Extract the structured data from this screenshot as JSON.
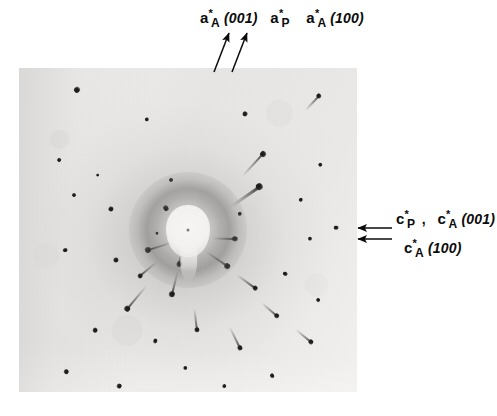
{
  "figure": {
    "kind": "x-ray-diffraction-photograph"
  },
  "labels": {
    "top": {
      "item1": {
        "symbol": "a",
        "star": "*",
        "subscript": "A",
        "miller": "(001)"
      },
      "item2": {
        "symbol": "a",
        "star": "*",
        "subscript": "P",
        "miller": ""
      },
      "item3": {
        "symbol": "a",
        "star": "*",
        "subscript": "A",
        "miller": "(100)"
      }
    },
    "right": {
      "line1": {
        "item1": {
          "symbol": "c",
          "star": "*",
          "subscript": "P",
          "miller": ""
        },
        "separator": ",",
        "item2": {
          "symbol": "c",
          "star": "*",
          "subscript": "A",
          "miller": "(001)"
        }
      },
      "line2": {
        "item1": {
          "symbol": "c",
          "star": "*",
          "subscript": "A",
          "miller": "(100)"
        }
      }
    }
  },
  "colors": {
    "ink": "#0b0b0b",
    "film_light": "#efeeec",
    "film_mid": "#e6e5e3",
    "spot_dark": "#171717"
  },
  "chart_data": {
    "type": "scatter",
    "title": "",
    "xlabel": "",
    "ylabel": "",
    "film_bounds": {
      "x": 19,
      "y": 68,
      "width": 338,
      "height": 324
    },
    "beam_center": {
      "x": 167,
      "y": 170
    },
    "note": "Spot coordinates are in film-local pixels; len = comet tail length in px, r = spot head radius in px, ang = tail direction degrees measured from beam center.",
    "spots": [
      {
        "x": 58,
        "y": 22,
        "r": 2.6,
        "len": 0
      },
      {
        "x": 128,
        "y": 51,
        "r": 2.0,
        "len": 0
      },
      {
        "x": 226,
        "y": 46,
        "r": 2.2,
        "len": 0
      },
      {
        "x": 300,
        "y": 28,
        "r": 2.4,
        "len": 20
      },
      {
        "x": 317,
        "y": 160,
        "r": 2.0,
        "len": 0
      },
      {
        "x": 40,
        "y": 92,
        "r": 1.6,
        "len": 0
      },
      {
        "x": 55,
        "y": 127,
        "r": 1.8,
        "len": 0
      },
      {
        "x": 92,
        "y": 141,
        "r": 2.2,
        "len": 0
      },
      {
        "x": 79,
        "y": 107,
        "r": 1.5,
        "len": 0
      },
      {
        "x": 152,
        "y": 112,
        "r": 1.7,
        "len": 0
      },
      {
        "x": 147,
        "y": 140,
        "r": 2.4,
        "len": 0
      },
      {
        "x": 138,
        "y": 165,
        "r": 1.5,
        "len": 0
      },
      {
        "x": 244,
        "y": 86,
        "r": 2.6,
        "len": 30
      },
      {
        "x": 240,
        "y": 119,
        "r": 3.2,
        "len": 34
      },
      {
        "x": 221,
        "y": 146,
        "r": 2.0,
        "len": 0
      },
      {
        "x": 282,
        "y": 132,
        "r": 2.0,
        "len": 0
      },
      {
        "x": 301,
        "y": 97,
        "r": 1.8,
        "len": 0
      },
      {
        "x": 46,
        "y": 182,
        "r": 1.9,
        "len": 0
      },
      {
        "x": 97,
        "y": 192,
        "r": 2.2,
        "len": 0
      },
      {
        "x": 129,
        "y": 182,
        "r": 2.6,
        "len": 26
      },
      {
        "x": 121,
        "y": 208,
        "r": 2.2,
        "len": 22
      },
      {
        "x": 108,
        "y": 241,
        "r": 2.6,
        "len": 30
      },
      {
        "x": 76,
        "y": 262,
        "r": 2.4,
        "len": 0
      },
      {
        "x": 136,
        "y": 273,
        "r": 2.0,
        "len": 0
      },
      {
        "x": 47,
        "y": 304,
        "r": 2.2,
        "len": 0
      },
      {
        "x": 100,
        "y": 318,
        "r": 2.4,
        "len": 0
      },
      {
        "x": 216,
        "y": 171,
        "r": 2.4,
        "len": 22
      },
      {
        "x": 208,
        "y": 198,
        "r": 2.6,
        "len": 26
      },
      {
        "x": 236,
        "y": 220,
        "r": 2.2,
        "len": 22
      },
      {
        "x": 266,
        "y": 206,
        "r": 2.0,
        "len": 0
      },
      {
        "x": 291,
        "y": 171,
        "r": 2.0,
        "len": 0
      },
      {
        "x": 258,
        "y": 248,
        "r": 2.2,
        "len": 20
      },
      {
        "x": 292,
        "y": 274,
        "r": 2.2,
        "len": 20
      },
      {
        "x": 221,
        "y": 280,
        "r": 2.2,
        "len": 24
      },
      {
        "x": 178,
        "y": 262,
        "r": 2.2,
        "len": 22
      },
      {
        "x": 166,
        "y": 300,
        "r": 2.0,
        "len": 0
      },
      {
        "x": 205,
        "y": 318,
        "r": 2.0,
        "len": 0
      },
      {
        "x": 253,
        "y": 308,
        "r": 2.0,
        "len": 0
      },
      {
        "x": 299,
        "y": 232,
        "r": 1.8,
        "len": 0
      },
      {
        "x": 153,
        "y": 226,
        "r": 2.6,
        "len": 24
      },
      {
        "x": 160,
        "y": 196,
        "r": 2.4,
        "len": 20
      }
    ]
  }
}
